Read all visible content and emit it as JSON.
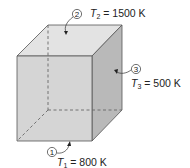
{
  "figure": {
    "type": "cube-radiation-enclosure",
    "colors": {
      "top_face": "#e3e3e3",
      "front_face": "#d5d5d5",
      "right_face": "#b9b9b9",
      "edge": "#555555",
      "hidden_edge": "#666666",
      "text": "#222222"
    },
    "surfaces": [
      {
        "number": "1",
        "symbol": "T",
        "subscript": "1",
        "equals": "=",
        "value": "800 K",
        "location": "bottom"
      },
      {
        "number": "2",
        "symbol": "T",
        "subscript": "2",
        "equals": "=",
        "value": "1500 K",
        "location": "top"
      },
      {
        "number": "3",
        "symbol": "T",
        "subscript": "3",
        "equals": "=",
        "value": "500 K",
        "location": "right side"
      }
    ]
  }
}
